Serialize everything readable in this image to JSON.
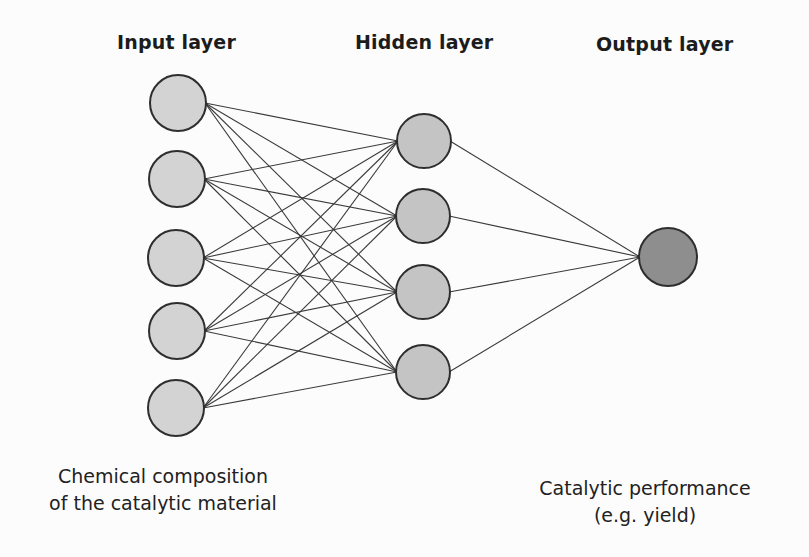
{
  "diagram": {
    "type": "neural-network",
    "layers": [
      {
        "id": "input",
        "title": "Input layer",
        "node_fill": "#d3d3d3",
        "nodes": [
          {
            "cx": 178,
            "cy": 103
          },
          {
            "cx": 177,
            "cy": 179
          },
          {
            "cx": 176,
            "cy": 258
          },
          {
            "cx": 177,
            "cy": 331
          },
          {
            "cx": 176,
            "cy": 408
          }
        ],
        "radius": 28
      },
      {
        "id": "hidden",
        "title": "Hidden layer",
        "node_fill": "#c4c4c4",
        "nodes": [
          {
            "cx": 424,
            "cy": 141
          },
          {
            "cx": 423,
            "cy": 216
          },
          {
            "cx": 423,
            "cy": 292
          },
          {
            "cx": 423,
            "cy": 372
          }
        ],
        "radius": 27
      },
      {
        "id": "output",
        "title": "Output layer",
        "node_fill": "#8e8e8e",
        "nodes": [
          {
            "cx": 668,
            "cy": 257
          }
        ],
        "radius": 29
      }
    ],
    "connections": "fully-connected between adjacent layers",
    "edge_color": "#3a3a3a",
    "node_stroke": "#2e2e2e",
    "captions": {
      "input": [
        "Chemical composition",
        "of the catalytic material"
      ],
      "output": [
        "Catalytic performance",
        "(e.g. yield)"
      ]
    }
  }
}
